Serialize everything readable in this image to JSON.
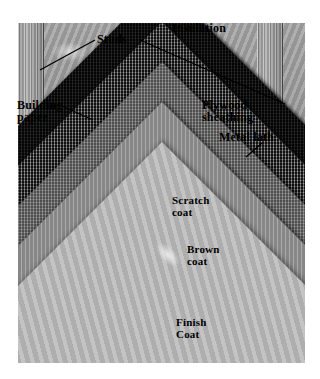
{
  "figure": {
    "background_color": "#ffffff",
    "photo": {
      "kind": "grayscale-photograph",
      "description": "Cutaway corner photograph of a three-coat stucco wall assembly showing nested chevron plies",
      "frame": {
        "x": 18,
        "y": 23,
        "width": 287,
        "height": 340
      }
    }
  },
  "labels": {
    "studs": {
      "line1": "Studs",
      "line2": ""
    },
    "insulation": {
      "line1": "Insulation",
      "line2": ""
    },
    "building_paper": {
      "line1": "Building",
      "line2": "paper"
    },
    "plywood_sheathing": {
      "line1": "Plywood",
      "line2": "sheathing"
    },
    "metal_lath": {
      "line1": "Metal lath",
      "line2": ""
    },
    "scratch_coat": {
      "line1": "Scratch",
      "line2": "coat"
    },
    "brown_coat": {
      "line1": "Brown",
      "line2": "coat"
    },
    "finish_coat": {
      "line1": "Finish",
      "line2": "Coat"
    }
  },
  "layers": [
    {
      "name": "Insulation",
      "order": 1,
      "color": "#a0a0a0"
    },
    {
      "name": "Studs",
      "order": 2,
      "color": "#9c9c9c"
    },
    {
      "name": "Plywood sheathing",
      "order": 3,
      "color": "#b8b8b8"
    },
    {
      "name": "Building paper",
      "order": 4,
      "color": "#131313"
    },
    {
      "name": "Metal lath",
      "order": 5,
      "color": "#4a4a4a"
    },
    {
      "name": "Scratch coat",
      "order": 6,
      "color": "#7b7b7b"
    },
    {
      "name": "Brown coat",
      "order": 7,
      "color": "#9d9d9d"
    },
    {
      "name": "Finish Coat",
      "order": 8,
      "color": "#bdbdbd"
    }
  ],
  "leader_lines": [
    {
      "for": "studs",
      "x1": 95,
      "y1": 40,
      "x2": 40,
      "y2": 70
    },
    {
      "for": "insulation",
      "x1": 140,
      "y1": 40,
      "x2": 285,
      "y2": 104
    },
    {
      "for": "building_paper",
      "x1": 62,
      "y1": 106,
      "x2": 93,
      "y2": 120
    },
    {
      "for": "metal_lath",
      "x1": 260,
      "y1": 143,
      "x2": 245,
      "y2": 156
    }
  ],
  "colors": {
    "page_background": "#ffffff",
    "text": "#000000",
    "leader_line": "#000000"
  }
}
